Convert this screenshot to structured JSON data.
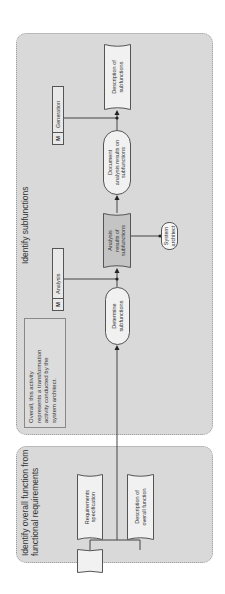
{
  "diagram": {
    "orientation": "rotated-90-ccw",
    "panels": {
      "left": {
        "title": "Identify overall function from functional requirements",
        "title_line1": "Identify overall function from",
        "title_line2": "functional requirements",
        "inputs": [
          {
            "label": "Requirements specification",
            "line1": "Requirements",
            "line2": "specification",
            "shape": "document"
          },
          {
            "label": "Description of overall function",
            "line1": "Description of",
            "line2": "overall function",
            "shape": "document"
          }
        ]
      },
      "right": {
        "title": "Identify subfunctions",
        "note": {
          "text": "Overall, this activity represents a transformation activity conducted by the system architect.",
          "lines": [
            "Overall, this activity",
            "represents a transformation",
            "activity conducted by the",
            "system architect."
          ]
        },
        "steps": [
          {
            "label": "Determine subfunctions",
            "line1": "Determine",
            "line2": "subfunctions",
            "shape": "oval"
          },
          {
            "label": "Analysis results of subfunctions",
            "line1": "Analysis",
            "line2": "results of",
            "line3": "subfunctions",
            "shape": "document",
            "shaded": true
          },
          {
            "label": "Document analysis results on subfunctions",
            "line1": "Document",
            "line2": "analysis results on",
            "line3": "subfunctions",
            "shape": "oval"
          },
          {
            "label": "Description of subfunctions",
            "line1": "Description of",
            "line2": "subfunctions",
            "shape": "document"
          }
        ],
        "actor": {
          "label": "System architect",
          "line1": "System",
          "line2": "architect",
          "shape": "oval"
        },
        "methods": [
          {
            "tag": "M",
            "label": "Analysis"
          },
          {
            "tag": "M",
            "label": "Generation"
          }
        ]
      }
    },
    "colors": {
      "panel_bg": "#d9d9d9",
      "shape_bg": "#f1f1f1",
      "shaded_doc_bg": "#c4c4c4",
      "line": "#444444"
    }
  }
}
